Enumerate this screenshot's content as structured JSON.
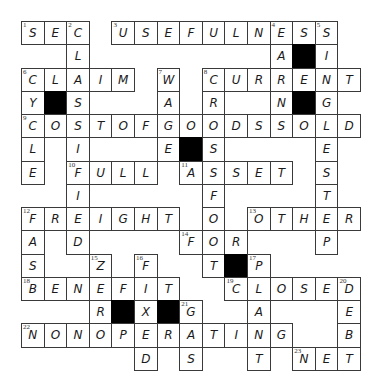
{
  "puzzle": {
    "rows": 15,
    "cols": 15,
    "colors": {
      "border": "#3a3a3a",
      "block": "#000000",
      "letter": "#1a1a1a",
      "background": "#ffffff"
    },
    "cells": [
      {
        "r": 0,
        "c": 0,
        "ch": "S",
        "n": "1"
      },
      {
        "r": 0,
        "c": 1,
        "ch": "E"
      },
      {
        "r": 0,
        "c": 2,
        "ch": "C",
        "n": "2"
      },
      {
        "r": 0,
        "c": 4,
        "ch": "U",
        "n": "3"
      },
      {
        "r": 0,
        "c": 5,
        "ch": "S"
      },
      {
        "r": 0,
        "c": 6,
        "ch": "E"
      },
      {
        "r": 0,
        "c": 7,
        "ch": "F"
      },
      {
        "r": 0,
        "c": 8,
        "ch": "U"
      },
      {
        "r": 0,
        "c": 9,
        "ch": "L"
      },
      {
        "r": 0,
        "c": 10,
        "ch": "N"
      },
      {
        "r": 0,
        "c": 11,
        "ch": "E",
        "n": "4"
      },
      {
        "r": 0,
        "c": 12,
        "ch": "S"
      },
      {
        "r": 0,
        "c": 13,
        "ch": "S",
        "n": "5"
      },
      {
        "r": 1,
        "c": 2,
        "ch": "L"
      },
      {
        "r": 1,
        "c": 11,
        "ch": "A"
      },
      {
        "r": 1,
        "c": 12,
        "block": true
      },
      {
        "r": 1,
        "c": 13,
        "ch": "I"
      },
      {
        "r": 2,
        "c": 0,
        "ch": "C",
        "n": "6"
      },
      {
        "r": 2,
        "c": 1,
        "ch": "L"
      },
      {
        "r": 2,
        "c": 2,
        "ch": "A"
      },
      {
        "r": 2,
        "c": 3,
        "ch": "I"
      },
      {
        "r": 2,
        "c": 4,
        "ch": "M"
      },
      {
        "r": 2,
        "c": 6,
        "ch": "W",
        "n": "7"
      },
      {
        "r": 2,
        "c": 8,
        "ch": "C",
        "n": "8"
      },
      {
        "r": 2,
        "c": 9,
        "ch": "U"
      },
      {
        "r": 2,
        "c": 10,
        "ch": "R"
      },
      {
        "r": 2,
        "c": 11,
        "ch": "R"
      },
      {
        "r": 2,
        "c": 12,
        "ch": "E"
      },
      {
        "r": 2,
        "c": 13,
        "ch": "N"
      },
      {
        "r": 2,
        "c": 14,
        "ch": "T"
      },
      {
        "r": 3,
        "c": 0,
        "ch": "Y"
      },
      {
        "r": 3,
        "c": 1,
        "block": true
      },
      {
        "r": 3,
        "c": 2,
        "ch": "S"
      },
      {
        "r": 3,
        "c": 6,
        "ch": "A"
      },
      {
        "r": 3,
        "c": 8,
        "ch": "R"
      },
      {
        "r": 3,
        "c": 11,
        "ch": "N"
      },
      {
        "r": 3,
        "c": 12,
        "block": true
      },
      {
        "r": 3,
        "c": 13,
        "ch": "G"
      },
      {
        "r": 4,
        "c": 0,
        "ch": "C",
        "n": "9"
      },
      {
        "r": 4,
        "c": 1,
        "ch": "O"
      },
      {
        "r": 4,
        "c": 2,
        "ch": "S"
      },
      {
        "r": 4,
        "c": 3,
        "ch": "T"
      },
      {
        "r": 4,
        "c": 4,
        "ch": "O"
      },
      {
        "r": 4,
        "c": 5,
        "ch": "F"
      },
      {
        "r": 4,
        "c": 6,
        "ch": "G"
      },
      {
        "r": 4,
        "c": 7,
        "ch": "O"
      },
      {
        "r": 4,
        "c": 8,
        "ch": "O"
      },
      {
        "r": 4,
        "c": 9,
        "ch": "D"
      },
      {
        "r": 4,
        "c": 10,
        "ch": "S"
      },
      {
        "r": 4,
        "c": 11,
        "ch": "S"
      },
      {
        "r": 4,
        "c": 12,
        "ch": "O"
      },
      {
        "r": 4,
        "c": 13,
        "ch": "L"
      },
      {
        "r": 4,
        "c": 14,
        "ch": "D"
      },
      {
        "r": 5,
        "c": 0,
        "ch": "L"
      },
      {
        "r": 5,
        "c": 2,
        "ch": "I"
      },
      {
        "r": 5,
        "c": 6,
        "ch": "E"
      },
      {
        "r": 5,
        "c": 7,
        "block": true
      },
      {
        "r": 5,
        "c": 8,
        "ch": "S"
      },
      {
        "r": 5,
        "c": 13,
        "ch": "E"
      },
      {
        "r": 6,
        "c": 0,
        "ch": "E"
      },
      {
        "r": 6,
        "c": 2,
        "ch": "F",
        "n": "10"
      },
      {
        "r": 6,
        "c": 3,
        "ch": "U"
      },
      {
        "r": 6,
        "c": 4,
        "ch": "L"
      },
      {
        "r": 6,
        "c": 5,
        "ch": "L"
      },
      {
        "r": 6,
        "c": 7,
        "ch": "A",
        "n": "11"
      },
      {
        "r": 6,
        "c": 8,
        "ch": "S"
      },
      {
        "r": 6,
        "c": 9,
        "ch": "S"
      },
      {
        "r": 6,
        "c": 10,
        "ch": "E"
      },
      {
        "r": 6,
        "c": 11,
        "ch": "T"
      },
      {
        "r": 6,
        "c": 13,
        "ch": "S"
      },
      {
        "r": 7,
        "c": 2,
        "ch": "I"
      },
      {
        "r": 7,
        "c": 8,
        "ch": "F"
      },
      {
        "r": 7,
        "c": 13,
        "ch": "T"
      },
      {
        "r": 8,
        "c": 0,
        "ch": "F",
        "n": "12"
      },
      {
        "r": 8,
        "c": 1,
        "ch": "R"
      },
      {
        "r": 8,
        "c": 2,
        "ch": "E"
      },
      {
        "r": 8,
        "c": 3,
        "ch": "I"
      },
      {
        "r": 8,
        "c": 4,
        "ch": "G"
      },
      {
        "r": 8,
        "c": 5,
        "ch": "H"
      },
      {
        "r": 8,
        "c": 6,
        "ch": "T"
      },
      {
        "r": 8,
        "c": 8,
        "ch": "O"
      },
      {
        "r": 8,
        "c": 10,
        "ch": "O",
        "n": "13"
      },
      {
        "r": 8,
        "c": 11,
        "ch": "T"
      },
      {
        "r": 8,
        "c": 12,
        "ch": "H"
      },
      {
        "r": 8,
        "c": 13,
        "ch": "E"
      },
      {
        "r": 8,
        "c": 14,
        "ch": "R"
      },
      {
        "r": 9,
        "c": 0,
        "ch": "A"
      },
      {
        "r": 9,
        "c": 2,
        "ch": "D"
      },
      {
        "r": 9,
        "c": 7,
        "ch": "F",
        "n": "14"
      },
      {
        "r": 9,
        "c": 8,
        "ch": "O"
      },
      {
        "r": 9,
        "c": 9,
        "ch": "R"
      },
      {
        "r": 9,
        "c": 13,
        "ch": "P"
      },
      {
        "r": 10,
        "c": 0,
        "ch": "S"
      },
      {
        "r": 10,
        "c": 3,
        "ch": "Z",
        "n": "15"
      },
      {
        "r": 10,
        "c": 5,
        "ch": "F",
        "n": "16"
      },
      {
        "r": 10,
        "c": 8,
        "ch": "T"
      },
      {
        "r": 10,
        "c": 9,
        "block": true
      },
      {
        "r": 10,
        "c": 10,
        "ch": "P",
        "n": "17"
      },
      {
        "r": 11,
        "c": 0,
        "ch": "B",
        "n": "18"
      },
      {
        "r": 11,
        "c": 1,
        "ch": "E"
      },
      {
        "r": 11,
        "c": 2,
        "ch": "N"
      },
      {
        "r": 11,
        "c": 3,
        "ch": "E"
      },
      {
        "r": 11,
        "c": 4,
        "ch": "F"
      },
      {
        "r": 11,
        "c": 5,
        "ch": "I"
      },
      {
        "r": 11,
        "c": 6,
        "ch": "T"
      },
      {
        "r": 11,
        "c": 9,
        "ch": "C",
        "n": "19"
      },
      {
        "r": 11,
        "c": 10,
        "ch": "L"
      },
      {
        "r": 11,
        "c": 11,
        "ch": "O"
      },
      {
        "r": 11,
        "c": 12,
        "ch": "S"
      },
      {
        "r": 11,
        "c": 13,
        "ch": "E"
      },
      {
        "r": 11,
        "c": 14,
        "ch": "D",
        "n": "20"
      },
      {
        "r": 12,
        "c": 3,
        "ch": "R"
      },
      {
        "r": 12,
        "c": 4,
        "block": true
      },
      {
        "r": 12,
        "c": 5,
        "ch": "X"
      },
      {
        "r": 12,
        "c": 6,
        "block": true
      },
      {
        "r": 12,
        "c": 7,
        "ch": "G",
        "n": "21"
      },
      {
        "r": 12,
        "c": 10,
        "ch": "A"
      },
      {
        "r": 12,
        "c": 14,
        "ch": "E"
      },
      {
        "r": 13,
        "c": 0,
        "ch": "N",
        "n": "22"
      },
      {
        "r": 13,
        "c": 1,
        "ch": "O"
      },
      {
        "r": 13,
        "c": 2,
        "ch": "N"
      },
      {
        "r": 13,
        "c": 3,
        "ch": "O"
      },
      {
        "r": 13,
        "c": 4,
        "ch": "P"
      },
      {
        "r": 13,
        "c": 5,
        "ch": "E"
      },
      {
        "r": 13,
        "c": 6,
        "ch": "R"
      },
      {
        "r": 13,
        "c": 7,
        "ch": "A"
      },
      {
        "r": 13,
        "c": 8,
        "ch": "T"
      },
      {
        "r": 13,
        "c": 9,
        "ch": "I"
      },
      {
        "r": 13,
        "c": 10,
        "ch": "N"
      },
      {
        "r": 13,
        "c": 11,
        "ch": "G"
      },
      {
        "r": 13,
        "c": 14,
        "ch": "B"
      },
      {
        "r": 14,
        "c": 5,
        "ch": "D"
      },
      {
        "r": 14,
        "c": 7,
        "ch": "S"
      },
      {
        "r": 14,
        "c": 10,
        "ch": "T"
      },
      {
        "r": 14,
        "c": 12,
        "ch": "N",
        "n": "23"
      },
      {
        "r": 14,
        "c": 13,
        "ch": "E"
      },
      {
        "r": 14,
        "c": 14,
        "ch": "T"
      }
    ],
    "across": [
      {
        "n": "1",
        "answer": "SEC"
      },
      {
        "n": "3",
        "answer": "USEFULNESS"
      },
      {
        "n": "6",
        "answer": "CLAIM"
      },
      {
        "n": "8",
        "answer": "CURRENT"
      },
      {
        "n": "9",
        "answer": "COSTOFGOODSSOLD"
      },
      {
        "n": "10",
        "answer": "FULL"
      },
      {
        "n": "11",
        "answer": "ASSET"
      },
      {
        "n": "12",
        "answer": "FREIGHT"
      },
      {
        "n": "13",
        "answer": "OTHER"
      },
      {
        "n": "14",
        "answer": "FOR"
      },
      {
        "n": "18",
        "answer": "BENEFIT"
      },
      {
        "n": "19",
        "answer": "CLOSED"
      },
      {
        "n": "22",
        "answer": "NONOPERATING"
      },
      {
        "n": "23",
        "answer": "NET"
      }
    ],
    "down": [
      {
        "n": "2",
        "answer": "CLASSIFIED"
      },
      {
        "n": "4",
        "answer": "EARNS"
      },
      {
        "n": "5",
        "answer": "SINGLESTEP"
      },
      {
        "n": "6",
        "answer": "CYCLE"
      },
      {
        "n": "7",
        "answer": "WAGE"
      },
      {
        "n": "8",
        "answer": "CROSSFOOT"
      },
      {
        "n": "12",
        "answer": "FASB"
      },
      {
        "n": "15",
        "answer": "ZERO"
      },
      {
        "n": "16",
        "answer": "FIXED"
      },
      {
        "n": "17",
        "answer": "PLANT"
      },
      {
        "n": "20",
        "answer": "DEBT"
      },
      {
        "n": "21",
        "answer": "GAS"
      }
    ]
  }
}
